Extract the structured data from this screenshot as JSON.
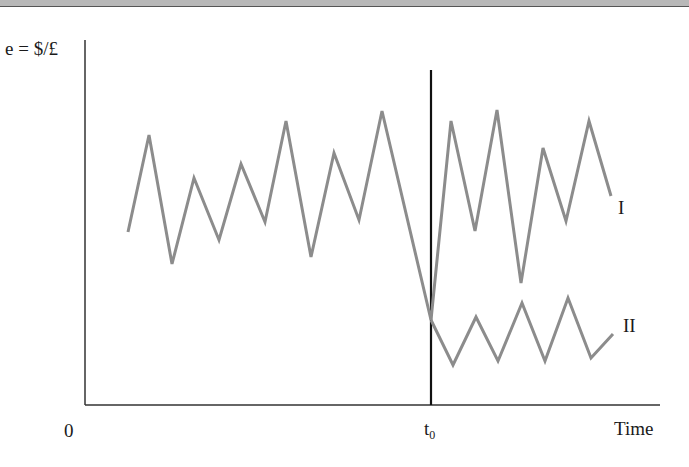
{
  "chart_data": {
    "type": "line",
    "title": "",
    "xlabel": "Time",
    "ylabel": "e = $/£",
    "x_ticks": [
      "0",
      "t0"
    ],
    "annotations": [
      "t0 vertical marker"
    ],
    "grid": false,
    "series": [
      {
        "name": "I",
        "points_px": [
          [
            128,
            232
          ],
          [
            149,
            135
          ],
          [
            172,
            264
          ],
          [
            194,
            178
          ],
          [
            219,
            240
          ],
          [
            241,
            164
          ],
          [
            265,
            222
          ],
          [
            286,
            121
          ],
          [
            311,
            257
          ],
          [
            334,
            153
          ],
          [
            359,
            220
          ],
          [
            382,
            111
          ],
          [
            431,
            320
          ],
          [
            451,
            121
          ],
          [
            475,
            231
          ],
          [
            497,
            110
          ],
          [
            521,
            283
          ],
          [
            543,
            148
          ],
          [
            566,
            221
          ],
          [
            589,
            121
          ],
          [
            611,
            196
          ]
        ]
      },
      {
        "name": "II",
        "points_px": [
          [
            431,
            320
          ],
          [
            453,
            365
          ],
          [
            476,
            317
          ],
          [
            498,
            361
          ],
          [
            522,
            303
          ],
          [
            545,
            361
          ],
          [
            568,
            298
          ],
          [
            591,
            358
          ],
          [
            613,
            334
          ]
        ]
      }
    ]
  },
  "labels": {
    "ylabel": "e = $/£",
    "origin": "0",
    "t0_main": "t",
    "t0_sub": "0",
    "xlabel": "Time",
    "series_I": "I",
    "series_II": "II"
  },
  "colors": {
    "series": "#8c8c8c",
    "axis": "#333333",
    "marker": "#111111"
  }
}
